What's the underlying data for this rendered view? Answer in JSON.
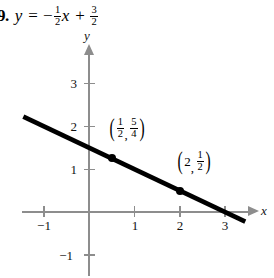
{
  "problem": {
    "marker": "9.",
    "equation": {
      "lhs": "y",
      "equals": "=",
      "minus": "−",
      "slope_num": "1",
      "slope_den": "2",
      "variable": "x",
      "plus": "+",
      "intercept_num": "3",
      "intercept_den": "2",
      "plain": "y = -1/2 x + 3/2"
    }
  },
  "chart_data": {
    "type": "line",
    "title": "",
    "xlabel": "x",
    "ylabel": "y",
    "equation": "y = -1/2x + 3/2",
    "slope": -0.5,
    "y_intercept": 1.5,
    "x_intercept": 3,
    "xlim": [
      -1.5,
      3.7
    ],
    "ylim": [
      -1.5,
      3.7
    ],
    "grid": false,
    "legend": false,
    "x_ticks": [
      -1,
      1,
      2,
      3
    ],
    "x_tick_labels": [
      "−1",
      "1",
      "2",
      "3"
    ],
    "y_ticks": [
      3,
      2,
      1,
      -1
    ],
    "y_tick_labels": [
      "3",
      "2",
      "1",
      "−1"
    ],
    "line_endpoints": [
      {
        "x": -1.45,
        "y": 2.225
      },
      {
        "x": 3.45,
        "y": -0.225
      }
    ],
    "points": [
      {
        "x": 0.5,
        "y": 1.25,
        "label_x_num": "1",
        "label_x_den": "2",
        "label_y_num": "5",
        "label_y_den": "4",
        "label": "(1/2, 5/4)"
      },
      {
        "x": 2,
        "y": 0.5,
        "label_x_whole": "2",
        "label_y_num": "1",
        "label_y_den": "2",
        "label": "(2, 1/2)"
      }
    ],
    "colors": {
      "line": "#000000",
      "axis": "#8d8d8d",
      "point": "#000000",
      "text": "#111111",
      "background": "#ffffff"
    }
  }
}
